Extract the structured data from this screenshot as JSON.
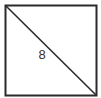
{
  "diagram": {
    "shape": "square",
    "diagonal": "top-left to bottom-right",
    "label": "8",
    "stroke_color": "#2b2b2b",
    "fill_color": "#ffffff"
  }
}
